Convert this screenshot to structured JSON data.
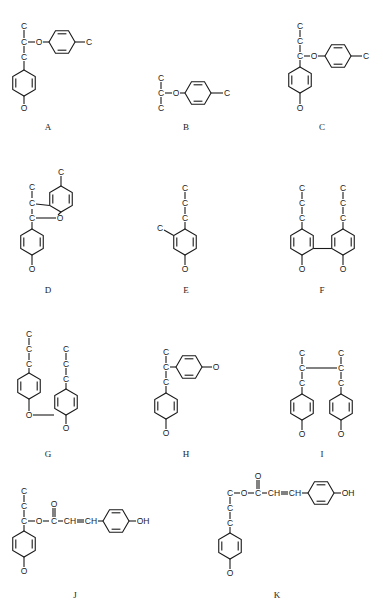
{
  "figure": {
    "compounds": [
      {
        "id": "A",
        "label": "A",
        "atoms": [
          "C",
          "C",
          "O",
          "C",
          "C",
          "O"
        ]
      },
      {
        "id": "B",
        "label": "B",
        "atoms": [
          "C",
          "C",
          "O",
          "C",
          "C"
        ]
      },
      {
        "id": "C",
        "label": "C",
        "atoms": [
          "C",
          "C",
          "C",
          "O",
          "C",
          "O"
        ]
      },
      {
        "id": "D",
        "label": "D",
        "atoms": [
          "C",
          "C",
          "C",
          "O",
          "C",
          "O"
        ]
      },
      {
        "id": "E",
        "label": "E",
        "atoms": [
          "C",
          "C",
          "C",
          "C",
          "O"
        ]
      },
      {
        "id": "F",
        "label": "F",
        "atoms": [
          "C",
          "C",
          "C",
          "O",
          "C",
          "C",
          "C",
          "O"
        ]
      },
      {
        "id": "G",
        "label": "G",
        "atoms": [
          "C",
          "C",
          "C",
          "O",
          "C",
          "C",
          "C",
          "O"
        ]
      },
      {
        "id": "H",
        "label": "H",
        "atoms": [
          "C",
          "C",
          "C",
          "O",
          "O"
        ]
      },
      {
        "id": "I",
        "label": "I",
        "atoms": [
          "C",
          "C",
          "C",
          "O",
          "C",
          "C",
          "C",
          "O"
        ]
      },
      {
        "id": "J",
        "label": "J",
        "atoms": [
          "C",
          "C",
          "C",
          "O",
          "C",
          "O",
          "CH",
          "CH",
          "OH",
          "O"
        ]
      },
      {
        "id": "K",
        "label": "K",
        "atoms": [
          "C",
          "O",
          "C",
          "O",
          "CH",
          "CH",
          "OH",
          "C",
          "C",
          "O"
        ]
      }
    ],
    "atom_text": {
      "C": "C",
      "O": "O",
      "CH": "CH",
      "OH": "OH"
    }
  }
}
